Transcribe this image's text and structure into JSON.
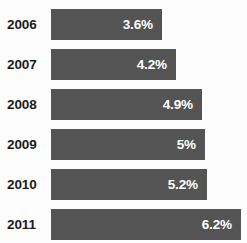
{
  "chart_data": {
    "type": "bar",
    "orientation": "horizontal",
    "title": "",
    "subtitle": "",
    "xlabel": "",
    "ylabel": "",
    "categories": [
      "2006",
      "2007",
      "2008",
      "2009",
      "2010",
      "2011"
    ],
    "values": [
      3.6,
      4.2,
      4.9,
      5,
      5.2,
      6.2
    ],
    "value_labels": [
      "3.6%",
      "4.2%",
      "4.9%",
      "5%",
      "5.2%",
      "6.2%"
    ],
    "unit": "%",
    "xlim": [
      0,
      6.2
    ],
    "grid": false,
    "legend": null,
    "series": [
      {
        "name": "",
        "values": [
          3.6,
          4.2,
          4.9,
          5,
          5.2,
          6.2
        ]
      }
    ],
    "colors": {
      "bar": "#545454",
      "value_text": "#ffffff",
      "category_text": "#1b1b1b",
      "background": "#fdfdfd"
    },
    "bars": [
      {
        "category": "2006",
        "value": 3.6,
        "label": "3.6%",
        "width_px": 111
      },
      {
        "category": "2007",
        "value": 4.2,
        "label": "4.2%",
        "width_px": 125
      },
      {
        "category": "2008",
        "value": 4.9,
        "label": "4.9%",
        "width_px": 151
      },
      {
        "category": "2009",
        "value": 5,
        "label": "5%",
        "width_px": 154
      },
      {
        "category": "2010",
        "value": 5.2,
        "label": "5.2%",
        "width_px": 156
      },
      {
        "category": "2011",
        "value": 6.2,
        "label": "6.2%",
        "width_px": 190
      }
    ],
    "layout": {
      "row_pitch_px": 40,
      "bar_height_px": 31,
      "bar_left_px": 51,
      "first_row_top_px": 9
    }
  }
}
